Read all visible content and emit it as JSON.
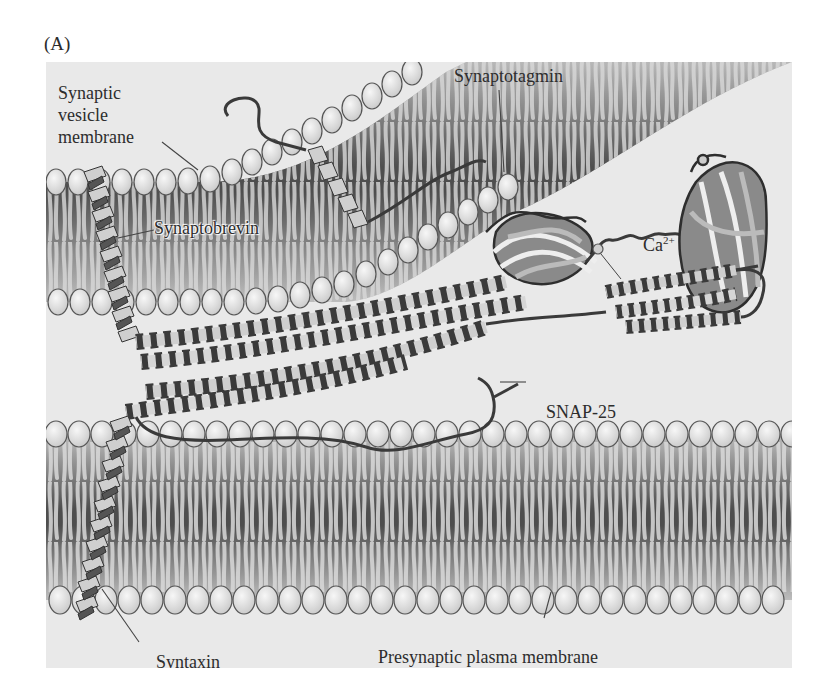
{
  "figure": {
    "panel_label": "(A)",
    "labels": {
      "synaptic_vesicle_membrane": [
        "Synaptic",
        "vesicle",
        "membrane"
      ],
      "synaptotagmin": "Synaptotagmin",
      "synaptobrevin": "Synaptobrevin",
      "calcium": "Ca",
      "calcium_charge": "2+",
      "snap25": "SNAP-25",
      "syntaxin": "Syntaxin",
      "presynaptic_plasma_membrane": "Presynaptic plasma membrane"
    },
    "colors": {
      "background": "#e9e9e9",
      "lipid_head": "#dcdcdc",
      "membrane_core": "#5a5a5a",
      "helix_light": "#cfcfcf",
      "helix_dark": "#555555",
      "outline": "#3a3a3a"
    }
  }
}
